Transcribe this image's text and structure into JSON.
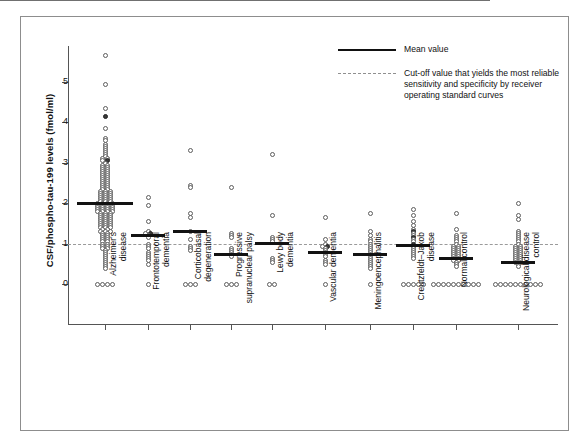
{
  "figure": {
    "y_axis_title": "CSF/phospho-tau-199 levels (fmol/ml)",
    "y_ticks": [
      "0",
      "1",
      "2",
      "3",
      "4",
      "5"
    ]
  },
  "legend": {
    "items": [
      {
        "style": "solid",
        "icon": "solid-line-icon",
        "label": "Mean value"
      },
      {
        "style": "dashed",
        "icon": "dashed-line-icon",
        "label": "Cut-off value that yields the most reliable sensitivity and specificity by receiver operating standard curves"
      }
    ]
  },
  "categories": [
    {
      "lines": [
        "Alzheimer's",
        "disease"
      ]
    },
    {
      "lines": [
        "Frontotemporal",
        "dementia"
      ]
    },
    {
      "lines": [
        "Corticobasal",
        "degeneration"
      ]
    },
    {
      "lines": [
        "Progressive",
        "supranuclear palsy"
      ]
    },
    {
      "lines": [
        "Lewy body",
        "dementia"
      ]
    },
    {
      "lines": [
        "Vascular dementia"
      ]
    },
    {
      "lines": [
        "Meningoencephalitis"
      ]
    },
    {
      "lines": [
        "Creutzfeldt–Jakob",
        "disease"
      ]
    },
    {
      "lines": [
        "Normal control"
      ]
    },
    {
      "lines": [
        "Neurological disease",
        "control"
      ]
    }
  ],
  "chart_data": {
    "type": "scatter",
    "title": "",
    "xlabel": "",
    "ylabel": "CSF/phospho-tau-199 levels (fmol/ml)",
    "ylim": [
      0,
      5.9
    ],
    "yticks": [
      0,
      1,
      2,
      3,
      4,
      5
    ],
    "grid": false,
    "legend_position": "top-right",
    "marker_styles": {
      "open_circle": "standard case",
      "filled_circle": "highlighted case"
    },
    "cutoff_value": 1.0,
    "cutoff_label": "Cut-off value that yields the most reliable sensitivity and specificity by receiver operating standard curves",
    "groups": [
      {
        "name": "Alzheimer's disease",
        "mean": 2.0,
        "n": 139,
        "values_open": [
          5.65,
          4.95,
          4.35,
          3.85,
          3.6,
          3.55,
          3.45,
          3.4,
          3.35,
          3.3,
          3.25,
          3.2,
          3.15,
          3.1,
          3.1,
          3.05,
          3.0,
          2.95,
          2.95,
          2.9,
          2.9,
          2.85,
          2.85,
          2.8,
          2.8,
          2.75,
          2.75,
          2.7,
          2.7,
          2.65,
          2.65,
          2.6,
          2.6,
          2.55,
          2.55,
          2.5,
          2.5,
          2.45,
          2.45,
          2.4,
          2.4,
          2.35,
          2.35,
          2.3,
          2.3,
          2.3,
          2.25,
          2.25,
          2.25,
          2.2,
          2.2,
          2.2,
          2.15,
          2.15,
          2.15,
          2.1,
          2.1,
          2.1,
          2.05,
          2.05,
          2.05,
          2.0,
          2.0,
          2.0,
          2.0,
          1.95,
          1.95,
          1.95,
          1.95,
          1.9,
          1.9,
          1.9,
          1.9,
          1.85,
          1.85,
          1.85,
          1.85,
          1.8,
          1.8,
          1.8,
          1.8,
          1.75,
          1.75,
          1.75,
          1.7,
          1.7,
          1.7,
          1.65,
          1.65,
          1.65,
          1.6,
          1.6,
          1.6,
          1.55,
          1.55,
          1.55,
          1.5,
          1.5,
          1.5,
          1.45,
          1.45,
          1.45,
          1.4,
          1.4,
          1.4,
          1.35,
          1.35,
          1.3,
          1.3,
          1.3,
          1.25,
          1.25,
          1.2,
          1.2,
          1.15,
          1.15,
          1.1,
          1.1,
          1.05,
          1.05,
          1.0,
          1.0,
          0.95,
          0.95,
          0.9,
          0.9,
          0.85,
          0.8,
          0.75,
          0.7,
          0.65,
          0.6,
          0.55,
          0.5,
          0.45,
          0.4,
          0.0,
          0.0,
          0.0,
          0.0
        ],
        "values_filled": [
          4.15,
          3.05
        ]
      },
      {
        "name": "Frontotemporal dementia",
        "mean": 1.2,
        "n": 17,
        "values_open": [
          2.15,
          1.95,
          1.55,
          1.3,
          1.25,
          1.2,
          1.15,
          1.0,
          0.95,
          0.9,
          0.8,
          0.75,
          0.7,
          0.65,
          0.6,
          0.5,
          0.0
        ],
        "values_filled": [
          1.25
        ]
      },
      {
        "name": "Corticobasal degeneration",
        "mean": 1.3,
        "n": 13,
        "values_open": [
          3.3,
          2.45,
          2.4,
          1.75,
          1.65,
          1.3,
          1.1,
          0.95,
          0.9,
          0.85,
          0.0,
          0.0,
          0.0
        ],
        "values_filled": []
      },
      {
        "name": "Progressive supranuclear palsy",
        "mean": 0.72,
        "n": 12,
        "values_open": [
          2.4,
          1.25,
          1.2,
          1.15,
          0.9,
          0.85,
          0.8,
          0.75,
          0.7,
          0.0,
          0.0,
          0.0
        ],
        "values_filled": []
      },
      {
        "name": "Lewy body dementia",
        "mean": 1.0,
        "n": 10,
        "values_open": [
          3.2,
          1.7,
          1.15,
          1.1,
          1.05,
          0.65,
          0.6,
          0.55,
          0.0,
          0.0
        ],
        "values_filled": []
      },
      {
        "name": "Vascular dementia",
        "mean": 0.78,
        "n": 13,
        "values_open": [
          1.65,
          1.1,
          1.0,
          0.95,
          0.9,
          0.85,
          0.8,
          0.75,
          0.7,
          0.6,
          0.55,
          0.5,
          0.0
        ],
        "values_filled": [
          0.95
        ]
      },
      {
        "name": "Meningoencephalitis",
        "mean": 0.73,
        "n": 19,
        "values_open": [
          1.75,
          1.3,
          1.2,
          1.1,
          1.05,
          1.0,
          0.95,
          0.9,
          0.85,
          0.8,
          0.75,
          0.7,
          0.65,
          0.6,
          0.55,
          0.5,
          0.45,
          0.4,
          0.0
        ],
        "values_filled": []
      },
      {
        "name": "Creutzfeldt–Jakob disease",
        "mean": 0.95,
        "n": 21,
        "values_open": [
          1.85,
          1.7,
          1.55,
          1.45,
          1.35,
          1.25,
          1.2,
          1.1,
          1.05,
          0.95,
          0.9,
          0.85,
          0.8,
          0.75,
          0.7,
          0.65,
          0.0,
          0.0,
          0.0,
          0.0,
          0.0
        ],
        "values_filled": [
          1.3,
          1.15,
          1.0
        ]
      },
      {
        "name": "Normal control",
        "mean": 0.62,
        "n": 36,
        "values_open": [
          1.75,
          1.35,
          1.2,
          1.15,
          1.1,
          1.05,
          1.0,
          0.95,
          0.95,
          0.9,
          0.9,
          0.85,
          0.85,
          0.8,
          0.8,
          0.75,
          0.75,
          0.7,
          0.7,
          0.65,
          0.65,
          0.6,
          0.6,
          0.55,
          0.5,
          0.45,
          0.0,
          0.0,
          0.0,
          0.0,
          0.0,
          0.0,
          0.0,
          0.0,
          0.0,
          0.0
        ],
        "values_filled": []
      },
      {
        "name": "Neurological disease control",
        "mean": 0.52,
        "n": 40,
        "values_open": [
          2.0,
          1.7,
          1.6,
          1.3,
          1.25,
          1.2,
          1.15,
          1.1,
          1.05,
          1.0,
          0.95,
          0.95,
          0.9,
          0.9,
          0.85,
          0.85,
          0.8,
          0.8,
          0.75,
          0.75,
          0.7,
          0.7,
          0.65,
          0.65,
          0.6,
          0.6,
          0.55,
          0.55,
          0.5,
          0.45,
          0.0,
          0.0,
          0.0,
          0.0,
          0.0,
          0.0,
          0.0,
          0.0,
          0.0,
          0.0
        ],
        "values_filled": []
      }
    ]
  }
}
